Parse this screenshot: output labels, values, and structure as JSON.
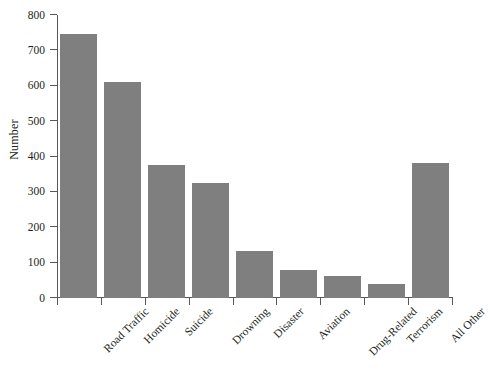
{
  "chart_data": {
    "type": "bar",
    "title": "",
    "xlabel": "",
    "ylabel": "Number",
    "categories": [
      "Road Traffic",
      "Homicide",
      "Suicide",
      "Drowning",
      "Disaster",
      "Aviation",
      "Drug-Related",
      "Terrorism",
      "All Other"
    ],
    "values": [
      745,
      610,
      375,
      325,
      133,
      80,
      62,
      40,
      383
    ],
    "ylim": [
      0,
      800
    ],
    "yticks": [
      0,
      100,
      200,
      300,
      400,
      500,
      600,
      700,
      800
    ],
    "ytick_labels": [
      "0",
      "100",
      "200",
      "300",
      "400",
      "500",
      "600",
      "700",
      "800"
    ],
    "grid": false,
    "legend": null,
    "bar_color": "#7f7f7f",
    "axis_color": "#595959"
  }
}
